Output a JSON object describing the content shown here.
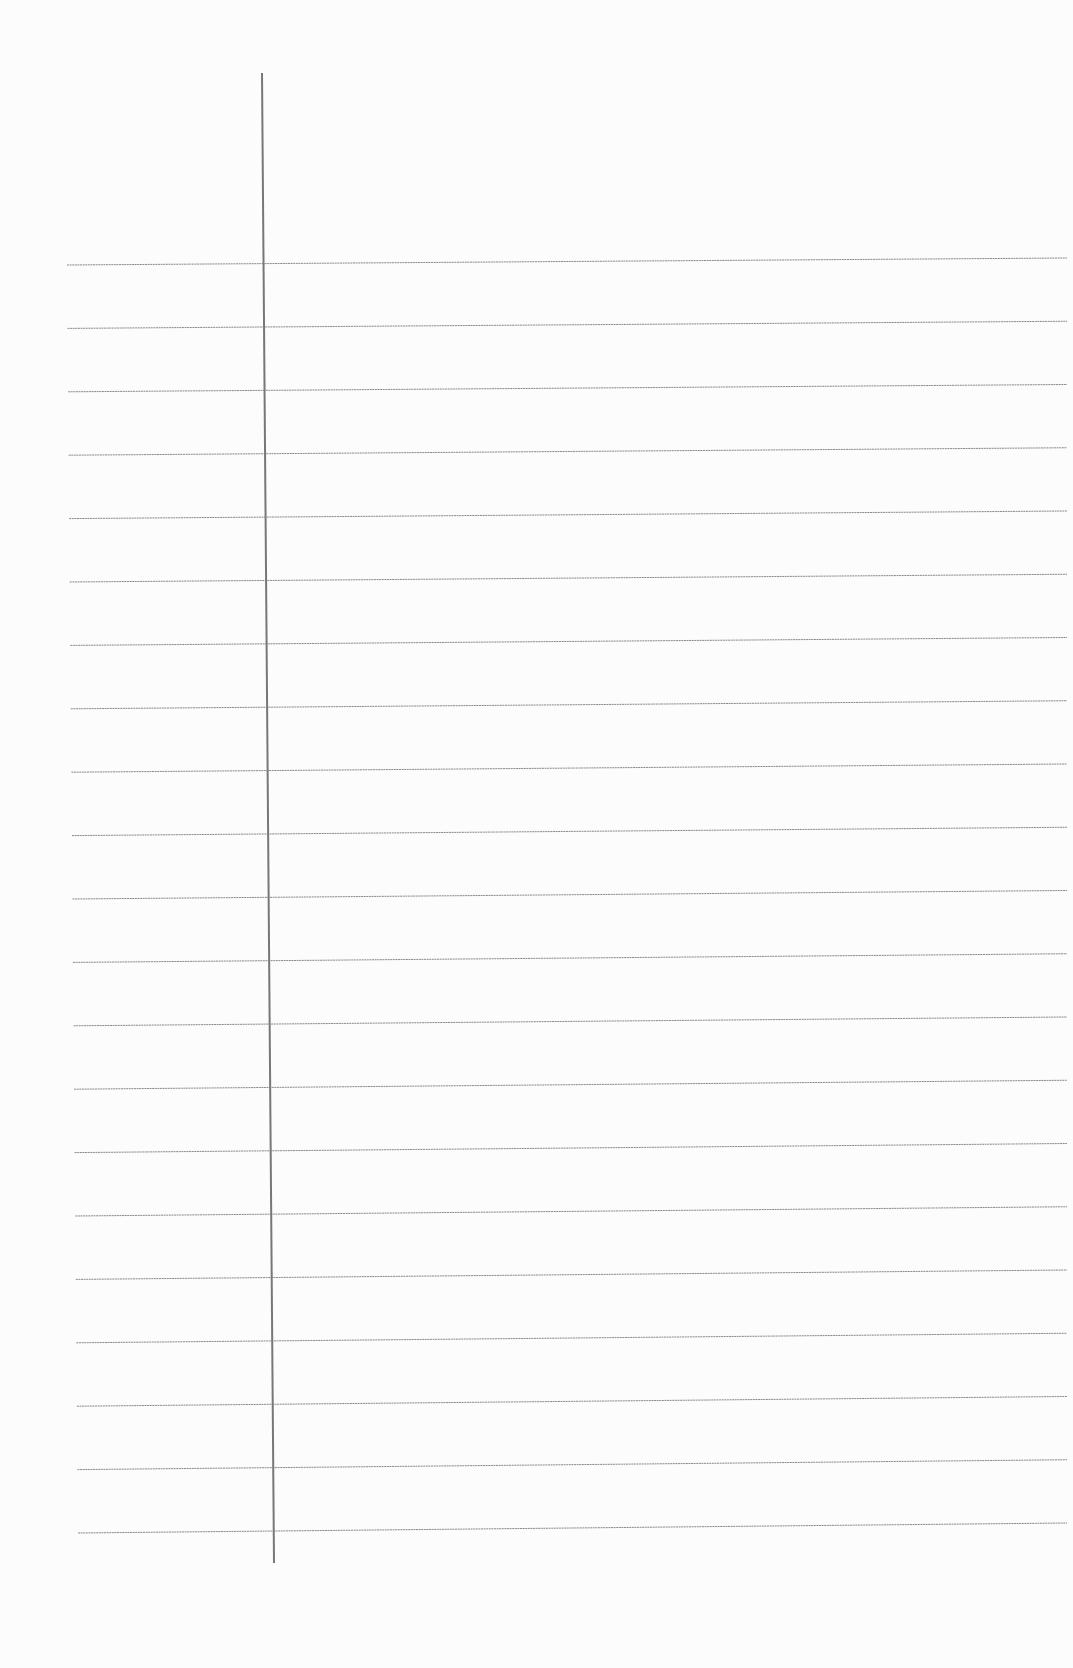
{
  "paper": {
    "type": "lined-paper",
    "background_color": "#fcfcfc",
    "rule_color": "#8a8a8a",
    "margin_color": "#777777",
    "rule_count": 21,
    "rules": {
      "left_start": [
        67,
        265
      ],
      "right_start": [
        1067,
        258
      ],
      "spacing": 63.4
    },
    "margin_line": {
      "x1": 262,
      "y1": 73,
      "x2": 274,
      "y2": 1563
    }
  }
}
